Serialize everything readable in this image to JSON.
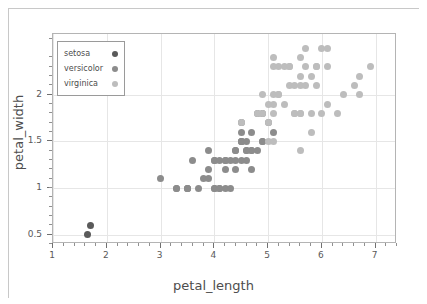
{
  "chart_data": {
    "type": "scatter",
    "title": "",
    "xlabel": "petal_length",
    "ylabel": "petal_width",
    "xlim": [
      1,
      7.4
    ],
    "ylim": [
      0.4,
      2.65
    ],
    "xticks": [
      1,
      2,
      3,
      4,
      5,
      6,
      7
    ],
    "yticks": [
      0.5,
      1,
      1.5,
      2
    ],
    "xtick_labels": [
      "1",
      "2",
      "3",
      "4",
      "5",
      "6",
      "7"
    ],
    "ytick_labels": [
      "0.5",
      "1",
      "1.5",
      "2"
    ],
    "grid": true,
    "legend_position": "upper-left",
    "series": [
      {
        "name": "setosa",
        "color": "#5a5a5a",
        "points": [
          [
            1.7,
            0.6
          ],
          [
            1.65,
            0.5
          ]
        ]
      },
      {
        "name": "versicolor",
        "color": "#8c8c8c",
        "points": [
          [
            3.0,
            1.1
          ],
          [
            3.3,
            1.0
          ],
          [
            3.5,
            1.0
          ],
          [
            3.5,
            1.0
          ],
          [
            3.6,
            1.3
          ],
          [
            3.7,
            1.0
          ],
          [
            3.8,
            1.1
          ],
          [
            3.9,
            1.2
          ],
          [
            3.9,
            1.4
          ],
          [
            4.0,
            1.0
          ],
          [
            4.0,
            1.3
          ],
          [
            4.0,
            1.3
          ],
          [
            4.1,
            1.0
          ],
          [
            4.1,
            1.3
          ],
          [
            4.2,
            1.2
          ],
          [
            4.2,
            1.3
          ],
          [
            4.2,
            1.3
          ],
          [
            4.3,
            1.3
          ],
          [
            4.4,
            1.2
          ],
          [
            4.4,
            1.4
          ],
          [
            4.4,
            1.4
          ],
          [
            4.5,
            1.3
          ],
          [
            4.5,
            1.5
          ],
          [
            4.5,
            1.5
          ],
          [
            4.5,
            1.5
          ],
          [
            4.5,
            1.6
          ],
          [
            4.5,
            1.7
          ],
          [
            4.6,
            1.3
          ],
          [
            4.6,
            1.4
          ],
          [
            4.6,
            1.5
          ],
          [
            4.7,
            1.2
          ],
          [
            4.7,
            1.4
          ],
          [
            4.7,
            1.4
          ],
          [
            4.7,
            1.6
          ],
          [
            4.8,
            1.4
          ],
          [
            4.8,
            1.8
          ],
          [
            4.9,
            1.5
          ],
          [
            4.9,
            1.5
          ],
          [
            4.9,
            1.8
          ],
          [
            5.0,
            1.7
          ],
          [
            5.1,
            1.6
          ],
          [
            3.3,
            1.0
          ],
          [
            4.0,
            1.0
          ],
          [
            4.1,
            1.0
          ],
          [
            4.2,
            1.0
          ],
          [
            4.3,
            1.0
          ],
          [
            3.9,
            1.1
          ],
          [
            3.5,
            1.0
          ],
          [
            4.6,
            1.4
          ],
          [
            4.4,
            1.3
          ]
        ]
      },
      {
        "name": "virginica",
        "color": "#bdbdbd",
        "points": [
          [
            4.5,
            1.7
          ],
          [
            4.8,
            1.8
          ],
          [
            4.9,
            1.8
          ],
          [
            4.9,
            2.0
          ],
          [
            5.0,
            1.5
          ],
          [
            5.0,
            1.7
          ],
          [
            5.1,
            1.5
          ],
          [
            5.1,
            1.9
          ],
          [
            5.1,
            2.0
          ],
          [
            5.1,
            2.3
          ],
          [
            5.1,
            2.4
          ],
          [
            5.2,
            2.0
          ],
          [
            5.2,
            2.3
          ],
          [
            5.3,
            1.9
          ],
          [
            5.3,
            2.3
          ],
          [
            5.4,
            2.1
          ],
          [
            5.4,
            2.3
          ],
          [
            5.5,
            1.8
          ],
          [
            5.5,
            2.1
          ],
          [
            5.6,
            1.4
          ],
          [
            5.6,
            1.8
          ],
          [
            5.6,
            2.1
          ],
          [
            5.6,
            2.2
          ],
          [
            5.6,
            2.4
          ],
          [
            5.7,
            2.1
          ],
          [
            5.7,
            2.3
          ],
          [
            5.7,
            2.5
          ],
          [
            5.8,
            1.6
          ],
          [
            5.8,
            1.8
          ],
          [
            5.8,
            2.2
          ],
          [
            5.9,
            2.1
          ],
          [
            5.9,
            2.3
          ],
          [
            6.0,
            1.8
          ],
          [
            6.0,
            2.5
          ],
          [
            6.1,
            1.9
          ],
          [
            6.1,
            2.3
          ],
          [
            6.1,
            2.5
          ],
          [
            6.3,
            1.8
          ],
          [
            6.4,
            2.0
          ],
          [
            6.6,
            2.1
          ],
          [
            6.7,
            2.0
          ],
          [
            6.7,
            2.2
          ],
          [
            6.9,
            2.3
          ],
          [
            5.0,
            1.9
          ],
          [
            5.2,
            2.0
          ],
          [
            5.5,
            1.8
          ],
          [
            5.6,
            1.8
          ],
          [
            5.4,
            2.3
          ],
          [
            5.1,
            1.8
          ],
          [
            5.9,
            2.3
          ]
        ]
      }
    ]
  },
  "legend": {
    "entries": [
      {
        "label": "setosa",
        "color": "#5a5a5a"
      },
      {
        "label": "versicolor",
        "color": "#8c8c8c"
      },
      {
        "label": "virginica",
        "color": "#bdbdbd"
      }
    ]
  },
  "axes": {
    "x_title": "petal_length",
    "y_title": "petal_width"
  }
}
